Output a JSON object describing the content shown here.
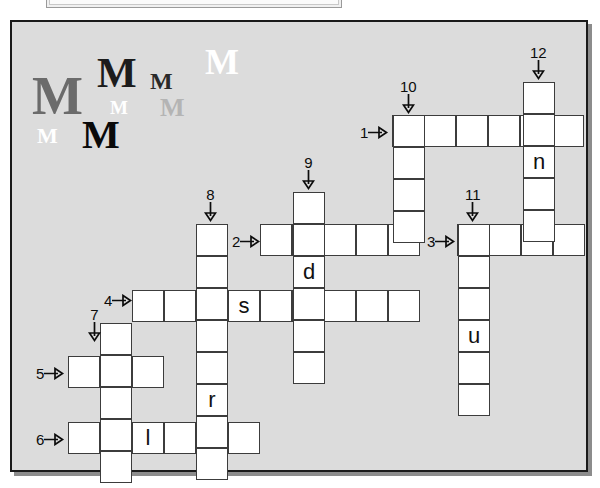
{
  "page": {
    "background": "#ffffff",
    "panel_background": "#dcdcdc",
    "cell_background": "#ffffff",
    "grid_line_color": "#3c3c3c"
  },
  "top_strip": {
    "label": ""
  },
  "decorative_letters": [
    {
      "char": "M",
      "x": 20,
      "y": 47,
      "size": 54,
      "color": "#6b6b6b"
    },
    {
      "char": "M",
      "x": 85,
      "y": 30,
      "size": 42,
      "color": "#1c1c1c"
    },
    {
      "char": "M",
      "x": 138,
      "y": 47,
      "size": 24,
      "color": "#2a2a2a"
    },
    {
      "char": "M",
      "x": 193,
      "y": 22,
      "size": 36,
      "color": "#ffffff"
    },
    {
      "char": "M",
      "x": 98,
      "y": 76,
      "size": 19,
      "color": "#ffffff"
    },
    {
      "char": "M",
      "x": 148,
      "y": 73,
      "size": 26,
      "color": "#b4b4b4"
    },
    {
      "char": "M",
      "x": 25,
      "y": 103,
      "size": 22,
      "color": "#ffffff"
    },
    {
      "char": "M",
      "x": 70,
      "y": 93,
      "size": 40,
      "color": "#0a0a0a"
    }
  ],
  "crossword": {
    "cell_size": 32,
    "entries": [
      {
        "id": "1",
        "direction": "across",
        "x": 380,
        "y": 93,
        "length": 6,
        "letters": [
          "",
          "",
          "",
          "",
          "",
          ""
        ]
      },
      {
        "id": "2",
        "direction": "across",
        "x": 248,
        "y": 202,
        "length": 5,
        "letters": [
          "",
          "",
          "",
          "",
          ""
        ]
      },
      {
        "id": "3",
        "direction": "across",
        "x": 445,
        "y": 202,
        "length": 4,
        "letters": [
          "",
          "",
          "",
          ""
        ]
      },
      {
        "id": "4",
        "direction": "across",
        "x": 120,
        "y": 268,
        "length": 9,
        "letters": [
          "",
          "",
          "",
          "s",
          "",
          "",
          "",
          "",
          ""
        ]
      },
      {
        "id": "5",
        "direction": "across",
        "x": 56,
        "y": 334,
        "length": 3,
        "letters": [
          "",
          "",
          ""
        ]
      },
      {
        "id": "6",
        "direction": "across",
        "x": 56,
        "y": 400,
        "length": 6,
        "letters": [
          "",
          "",
          "l",
          "",
          "",
          ""
        ]
      },
      {
        "id": "7",
        "direction": "down",
        "x": 88,
        "y": 301,
        "length": 5,
        "letters": [
          "",
          "",
          "",
          "",
          ""
        ]
      },
      {
        "id": "8",
        "direction": "down",
        "x": 184,
        "y": 202,
        "length": 8,
        "letters": [
          "",
          "",
          "",
          "",
          "",
          "r",
          "",
          ""
        ]
      },
      {
        "id": "9",
        "direction": "down",
        "x": 281,
        "y": 170,
        "length": 6,
        "letters": [
          "",
          "",
          "d",
          "",
          "",
          ""
        ]
      },
      {
        "id": "10",
        "direction": "down",
        "x": 381,
        "y": 93,
        "length": 4,
        "letters": [
          "",
          "",
          "",
          ""
        ]
      },
      {
        "id": "11",
        "direction": "down",
        "x": 446,
        "y": 202,
        "length": 6,
        "letters": [
          "",
          "",
          "",
          "u",
          "",
          ""
        ]
      },
      {
        "id": "12",
        "direction": "down",
        "x": 511,
        "y": 60,
        "length": 5,
        "letters": [
          "",
          "",
          "n",
          "",
          ""
        ]
      }
    ],
    "markers": [
      {
        "id": "1",
        "label": "1",
        "direction": "across",
        "x": 348,
        "y": 103
      },
      {
        "id": "2",
        "label": "2",
        "direction": "across",
        "x": 220,
        "y": 212
      },
      {
        "id": "3",
        "label": "3",
        "direction": "across",
        "x": 415,
        "y": 212
      },
      {
        "id": "4",
        "label": "4",
        "direction": "across",
        "x": 92,
        "y": 271
      },
      {
        "id": "5",
        "label": "5",
        "direction": "across",
        "x": 24,
        "y": 344
      },
      {
        "id": "6",
        "label": "6",
        "direction": "across",
        "x": 24,
        "y": 410
      },
      {
        "id": "7",
        "label": "7",
        "direction": "down",
        "x": 76,
        "y": 285
      },
      {
        "id": "8",
        "label": "8",
        "direction": "down",
        "x": 192,
        "y": 165
      },
      {
        "id": "9",
        "label": "9",
        "direction": "down",
        "x": 290,
        "y": 133
      },
      {
        "id": "10",
        "label": "10",
        "direction": "down",
        "x": 388,
        "y": 57
      },
      {
        "id": "11",
        "label": "11",
        "direction": "down",
        "x": 453,
        "y": 165
      },
      {
        "id": "12",
        "label": "12",
        "direction": "down",
        "x": 518,
        "y": 23
      }
    ]
  }
}
